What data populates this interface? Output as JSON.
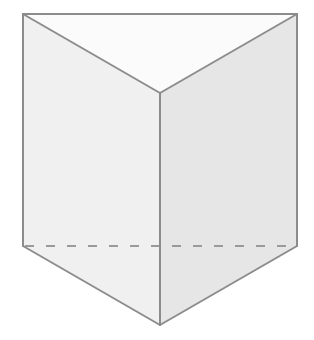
{
  "diagram": {
    "type": "triangular-prism",
    "colors": {
      "background": "#ffffff",
      "top_face": "#fbfbfb",
      "left_face": "#f0f0f0",
      "right_face": "#e6e6e6",
      "bottom_face": "#eeeeee",
      "edge": "#8c8c8c",
      "hidden_edge": "#9a9a9a"
    },
    "vertices": {
      "top_left": [
        23,
        14
      ],
      "top_right": [
        297,
        14
      ],
      "top_front": [
        160,
        93
      ],
      "bottom_left": [
        23,
        246
      ],
      "bottom_right": [
        297,
        246
      ],
      "bottom_front": [
        160,
        325
      ]
    },
    "visible_edges": [
      [
        "top_left",
        "top_right"
      ],
      [
        "top_left",
        "top_front"
      ],
      [
        "top_right",
        "top_front"
      ],
      [
        "top_left",
        "bottom_left"
      ],
      [
        "top_right",
        "bottom_right"
      ],
      [
        "top_front",
        "bottom_front"
      ],
      [
        "bottom_left",
        "bottom_front"
      ],
      [
        "bottom_right",
        "bottom_front"
      ]
    ],
    "hidden_edges": [
      [
        "bottom_left",
        "bottom_right"
      ]
    ]
  }
}
